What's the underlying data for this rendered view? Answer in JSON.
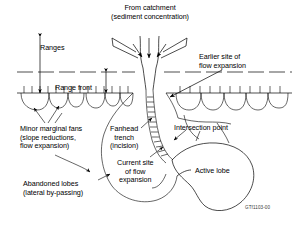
{
  "figure": {
    "domain": "diagram",
    "credit_code": "GTf1103-00",
    "background_color": "#ffffff",
    "line_color": "#000000"
  },
  "labels": {
    "catchment": {
      "line1": "From catchment",
      "line2": "(sediment concentration)"
    },
    "ranges": "Ranges",
    "range_front": "Range front",
    "earlier_site": {
      "line1": "Earlier site of",
      "line2": "flow expansion"
    },
    "minor_marginal_fans": {
      "line1": "Minor marginal fans",
      "line2": "(slope reductions,",
      "line3": "flow expansion)"
    },
    "fanhead_trench": {
      "line1": "Fanhead",
      "line2": "trench",
      "line3": "(incision)"
    },
    "intersection_point": "Intersection point",
    "current_site": {
      "line1": "Current site",
      "line2": "of flow",
      "line3": "expansion"
    },
    "active_lobe": "Active lobe",
    "abandoned_lobes": {
      "line1": "Abandoned lobes",
      "line2": "(lateral by-passing)"
    }
  },
  "icons": {
    "arrow_down": "arrow-down-icon",
    "arrow_leader": "leader-arrow-icon",
    "range_front_line": "dashed-range-front-line",
    "fan_toe": "fan-toe-scallop"
  }
}
